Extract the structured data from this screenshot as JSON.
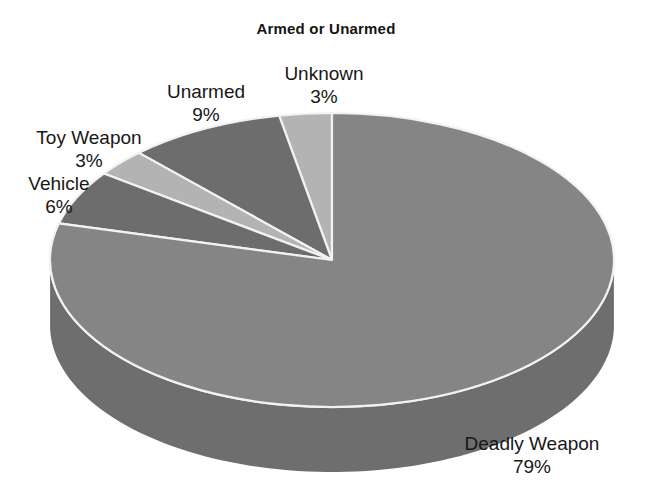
{
  "chart_data": {
    "type": "pie",
    "title": "Armed or Unarmed",
    "xlabel": "",
    "ylabel": "",
    "legend": "none",
    "grid": false,
    "three_d": true,
    "start_angle_deg": 90,
    "direction": "counterclockwise",
    "categories": [
      "Unknown",
      "Unarmed",
      "Toy Weapon",
      "Vehicle",
      "Deadly Weapon"
    ],
    "values": [
      3,
      9,
      3,
      6,
      79
    ],
    "value_unit": "%",
    "slices": [
      {
        "label": "Unknown",
        "percent": 3,
        "percent_text": "3%",
        "color": "#b3b3b3",
        "side_color": "#8e8e8e"
      },
      {
        "label": "Unarmed",
        "percent": 9,
        "percent_text": "9%",
        "color": "#6d6d6d",
        "side_color": "#585858"
      },
      {
        "label": "Toy Weapon",
        "percent": 3,
        "percent_text": "3%",
        "color": "#b3b3b3",
        "side_color": "#8e8e8e"
      },
      {
        "label": "Vehicle",
        "percent": 6,
        "percent_text": "6%",
        "color": "#6d6d6d",
        "side_color": "#585858"
      },
      {
        "label": "Deadly Weapon",
        "percent": 79,
        "percent_text": "79%",
        "color": "#858585",
        "side_color": "#6e6e6e"
      }
    ]
  },
  "chart": {
    "title": "Armed or Unarmed",
    "background": "#ffffff",
    "separator_color": "#f2f2f2"
  },
  "labels": {
    "unknown": {
      "name": "Unknown",
      "percent": "3%"
    },
    "unarmed": {
      "name": "Unarmed",
      "percent": "9%"
    },
    "toy": {
      "name": "Toy Weapon",
      "percent": "3%"
    },
    "vehicle": {
      "name": "Vehicle",
      "percent": "6%"
    },
    "deadly": {
      "name": "Deadly Weapon",
      "percent": "79%"
    }
  }
}
